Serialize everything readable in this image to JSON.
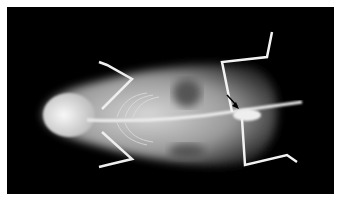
{
  "image": {
    "subject": "Dorsoventral radiograph of a small rodent",
    "annotation": {
      "type": "arrow",
      "color": "#000000",
      "target": "pelvic region near base of tail"
    },
    "background_color": "#000000",
    "border_color": "#ffffff"
  }
}
